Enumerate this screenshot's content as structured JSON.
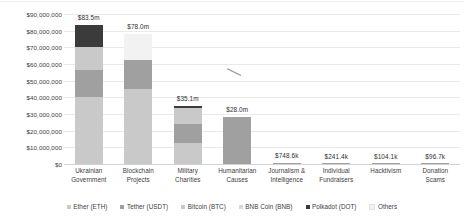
{
  "chart_data": {
    "type": "bar",
    "subtype": "stacked-bar",
    "title": "",
    "xlabel": "",
    "ylabel": "",
    "ylim": [
      0,
      90000000
    ],
    "ytick_step": 10000000,
    "grid": true,
    "legend_position": "bottom",
    "ytick_labels": [
      "$90,000,000",
      "$80,000,000",
      "$70,000,000",
      "$60,000,000",
      "$50,000,000",
      "$40,000,000",
      "$30,000,000",
      "$20,000,000",
      "$10,000,000",
      "$0"
    ],
    "ytick_values": [
      90000000,
      80000000,
      70000000,
      60000000,
      50000000,
      40000000,
      30000000,
      20000000,
      10000000,
      0
    ],
    "categories": [
      "Ukrainian Government",
      "Blockchain Projects",
      "Military Charities",
      "Humanitarian Causes",
      "Journalism & Intelligence",
      "Individual Fundraisers",
      "Hacktivism",
      "Donation Scams"
    ],
    "category_lines": [
      [
        "Ukrainian",
        "Government"
      ],
      [
        "Blockchain",
        "Projects"
      ],
      [
        "Military",
        "Charities"
      ],
      [
        "Humanitarian",
        "Causes"
      ],
      [
        "Journalism &",
        "Intelligence"
      ],
      [
        "Individual",
        "Fundraisers"
      ],
      [
        "Hacktivism",
        ""
      ],
      [
        "Donation",
        "Scams"
      ]
    ],
    "totals": [
      83500000,
      78000000,
      35100000,
      28000000,
      748600,
      241400,
      104100,
      96700
    ],
    "total_labels": [
      "$83.5m",
      "$78.0m",
      "$35.1m",
      "$28.0m",
      "$748.6k",
      "$241.4k",
      "$104.1k",
      "$96.7k"
    ],
    "series": [
      {
        "name": "Ether (ETH)",
        "color": "#c9c9c9",
        "values": [
          40000000,
          45000000,
          12500000,
          0,
          0,
          0,
          0,
          0
        ]
      },
      {
        "name": "Tether (USDT)",
        "color": "#a0a0a0",
        "values": [
          16500000,
          17500000,
          11500000,
          28000000,
          748600,
          241400,
          104100,
          96700
        ]
      },
      {
        "name": "Bitcoin (BTC)",
        "color": "#c9c9c9",
        "values": [
          14000000,
          0,
          9700000,
          0,
          0,
          0,
          0,
          0
        ]
      },
      {
        "name": "BNB Coin (BNB)",
        "color": "#bdbdbd",
        "values": [
          0,
          0,
          0,
          0,
          0,
          0,
          0,
          0
        ]
      },
      {
        "name": "Polkadot (DOT)",
        "color": "#3b3b3b",
        "values": [
          13000000,
          0,
          1400000,
          0,
          0,
          0,
          0,
          0
        ]
      },
      {
        "name": "Others",
        "color": "#f2f2f2",
        "values": [
          0,
          15500000,
          0,
          0,
          0,
          0,
          0,
          0
        ]
      }
    ],
    "legend": [
      {
        "label": "Ether (ETH)",
        "color": "#c9c9c9"
      },
      {
        "label": "Tether (USDT)",
        "color": "#a0a0a0"
      },
      {
        "label": "Bitcoin (BTC)",
        "color": "#c9c9c9"
      },
      {
        "label": "BNB Coin (BNB)",
        "color": "#d8d8d8"
      },
      {
        "label": "Polkadot (DOT)",
        "color": "#3b3b3b"
      },
      {
        "label": "Others",
        "color": "#f2f2f2"
      }
    ]
  },
  "colors": {
    "grid": "#e9e9e9",
    "axis": "#d2d2d2",
    "text": "#3d3d3d",
    "background": "#ffffff"
  }
}
